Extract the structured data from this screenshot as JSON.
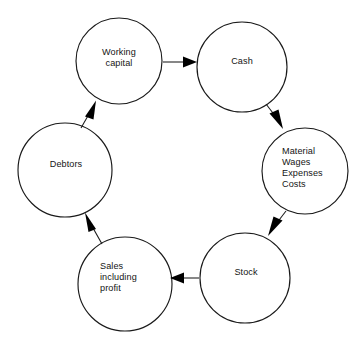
{
  "diagram": {
    "type": "cycle-diagram",
    "background_color": "#ffffff",
    "stroke_color": "#1a1a1a",
    "text_color": "#141414",
    "nodes": [
      {
        "id": "working-capital",
        "label": "Working\ncapital",
        "cx": 119,
        "cy": 61,
        "r": 43,
        "align": "center"
      },
      {
        "id": "cash",
        "label": "Cash",
        "cx": 242,
        "cy": 67,
        "r": 45,
        "align": "center"
      },
      {
        "id": "material-wages-expenses-costs",
        "label": "Material\nWages\nExpenses\nCosts",
        "cx": 305,
        "cy": 171,
        "r": 43,
        "align": "left"
      },
      {
        "id": "stock",
        "label": "Stock",
        "cx": 245,
        "cy": 278,
        "r": 45,
        "align": "center"
      },
      {
        "id": "sales-including-profit",
        "label": "Sales\nincluding\nprofit",
        "cx": 125,
        "cy": 284,
        "r": 47,
        "align": "left"
      },
      {
        "id": "debtors",
        "label": "Debtors",
        "cx": 65,
        "cy": 170,
        "r": 47,
        "align": "center"
      }
    ],
    "arrows": [
      {
        "id": "working-capital-to-cash",
        "from": "working-capital",
        "to": "cash",
        "x1": 163,
        "y1": 62,
        "x2": 196,
        "y2": 62
      },
      {
        "id": "cash-to-material",
        "from": "cash",
        "to": "material-wages-expenses-costs",
        "x1": 266,
        "y1": 105,
        "x2": 283,
        "y2": 128
      },
      {
        "id": "material-to-stock",
        "from": "material-wages-expenses-costs",
        "to": "stock",
        "x1": 285,
        "y1": 212,
        "x2": 268,
        "y2": 235
      },
      {
        "id": "stock-to-sales",
        "from": "stock",
        "to": "sales-including-profit",
        "x1": 199,
        "y1": 278,
        "x2": 173,
        "y2": 278
      },
      {
        "id": "sales-to-debtors",
        "from": "sales-including-profit",
        "to": "debtors",
        "x1": 101,
        "y1": 243,
        "x2": 86,
        "y2": 216
      },
      {
        "id": "debtors-to-working-capital",
        "from": "debtors",
        "to": "working-capital",
        "x1": 81,
        "y1": 127,
        "x2": 95,
        "y2": 102
      }
    ],
    "node_labels": [
      {
        "id": "label-working-capital",
        "text": "Working\ncapital",
        "left": 92,
        "top": 47,
        "width": 54,
        "align": "center"
      },
      {
        "id": "label-cash",
        "text": "Cash",
        "left": 218,
        "top": 56,
        "width": 48,
        "align": "center"
      },
      {
        "id": "label-material",
        "text": "Material\nWages\nExpenses\nCosts",
        "left": 282,
        "top": 146,
        "width": 58,
        "align": "left"
      },
      {
        "id": "label-stock",
        "text": "Stock",
        "left": 222,
        "top": 267,
        "width": 48,
        "align": "center"
      },
      {
        "id": "label-sales",
        "text": "Sales\nincluding\nprofit",
        "left": 100,
        "top": 261,
        "width": 58,
        "align": "left"
      },
      {
        "id": "label-debtors",
        "text": "Debtors",
        "left": 40,
        "top": 159,
        "width": 52,
        "align": "center"
      }
    ]
  }
}
